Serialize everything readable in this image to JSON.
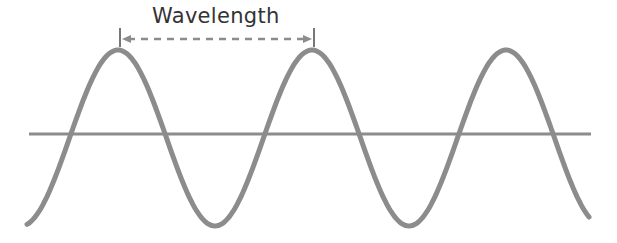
{
  "diagram": {
    "title": "Wavelength",
    "colors": {
      "wave": "#8c8c8c",
      "axis": "#8c8c8c",
      "annotation": "#8c8c8c",
      "text": "#333333"
    },
    "wave": {
      "cycles": 3,
      "period_px": 194,
      "peaks_x": [
        118,
        312,
        498
      ],
      "troughs_x": [
        215,
        405
      ]
    },
    "annotation": {
      "label": "Wavelength",
      "from_peak": 1,
      "to_peak": 2,
      "style": "dashed double-headed arrow"
    }
  }
}
